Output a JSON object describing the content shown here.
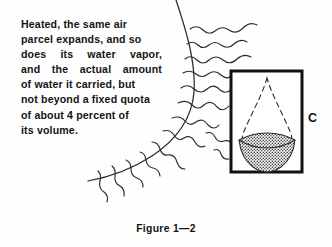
{
  "page": {
    "width": 332,
    "height": 247,
    "background_color": "#fefefe",
    "ink_color": "#141414"
  },
  "body_text": {
    "full_text": "Heated, the same air parcel expands, and so does its water vapor, and the actual amount of water it carried, but not beyond a fixed quota of about 4 percent of its volume.",
    "lines": [
      {
        "text": "Heated, the same air",
        "words": [
          "Heated,",
          "the",
          "same",
          "air"
        ],
        "justified": false
      },
      {
        "text": "parcel expands, and so",
        "words": [
          "parcel",
          "expands,",
          "and",
          "so"
        ],
        "justified": false
      },
      {
        "text": "does its water vapor,",
        "words": [
          "does",
          "its",
          "water",
          "vapor,"
        ],
        "justified": true
      },
      {
        "text": "and the actual amount",
        "words": [
          "and",
          "the",
          "actual",
          "amount"
        ],
        "justified": true
      },
      {
        "text": "of water it carried, but",
        "words": [
          "of",
          "water",
          "it",
          "carried,",
          "but"
        ],
        "justified": false
      },
      {
        "text": "not beyond a fixed quota",
        "words": [
          "not",
          "beyond",
          "a",
          "fixed",
          "quota"
        ],
        "justified": false
      },
      {
        "text": "of about 4 percent of",
        "words": [
          "of",
          "about",
          "4",
          "percent",
          "of"
        ],
        "justified": false
      },
      {
        "text": "its volume.",
        "words": [
          "its",
          "volume."
        ],
        "justified": false
      }
    ]
  },
  "caption": {
    "label": "Figure 1—2"
  },
  "box": {
    "label": "C",
    "frame": {
      "x": 230,
      "y": 70,
      "width": 73,
      "height": 103,
      "stroke": "#111111",
      "stroke_width": 3
    },
    "droplet": {
      "description": "dashed teardrop outline",
      "style": "dashed",
      "stroke": "#2b2b2b"
    },
    "bowl": {
      "description": "stippled dotted bowl at droplet base",
      "fill_pattern": "stipple-dots",
      "stroke": "#2b2b2b"
    }
  },
  "air_parcel": {
    "description": "large hand-drawn arc marking the boundary of the expanded air parcel",
    "stroke": "#2b2b2b",
    "start": {
      "x": 176,
      "y": 0
    },
    "end": {
      "x": 88,
      "y": 181
    }
  },
  "vapor_squiggles": {
    "description": "hand-drawn wavy lines representing water vapor radiating from the air parcel",
    "count": 14,
    "stroke": "#2b2b2b",
    "paths": [
      "M 190 29 q 7 -5 13 1 q 6 6 12 1 q 7 -6 14 -1 q 7 5 14 -2 q 7 -7 14 -3",
      "M 187 44 q 6 -4 11 1 q 5 5 11 0 q 6 -5 12 0 q 7 5 13 -1 q 7 -6 13 -2",
      "M 185 59 q 6 -5 12 1 q 6 6 12 0 q 7 -6 14 0 q 7 6 14 -1 q 7 -6 14 -2",
      "M 183 73 q 7 -4 13 1 q 6 5 12 0 q 7 -5 13 1 q 7 6 13 -1",
      "M 181 88 q 7 -5 13 1 q 7 6 13 0 q 7 -6 13 1 q 6 5 12 -1",
      "M 178 103 q 8 -4 14 2 q 6 6 12 0 q 7 -6 13 2 q 6 6 12 -1",
      "M 172 118 q 8 -3 13 3 q 5 6 11 1 q 7 -5 12 3",
      "M 163 131 q 7 -2 11 4 q 4 7 10 3 q 7 -4 11 4",
      "M 152 142 q 6 0 8 7 q 2 7 8 6 q 7 -1 9 7",
      "M 140 152 q 5 1 6 8 q 1 7 7 8 q 6 1 7 8",
      "M 126 160 q 5 2 5 9 q 0 7 6 9 q 6 2 6 9",
      "M 112 166 q 4 3 3 10 q -1 7 5 10 q 5 3 4 10",
      "M 98 170 q 4 4 2 10 q -2 7 4 11 q 5 4 3 10",
      "M 206 133 q 6 -2 9 4 q 3 6 9 4 q 6 -2 9 5"
    ]
  }
}
